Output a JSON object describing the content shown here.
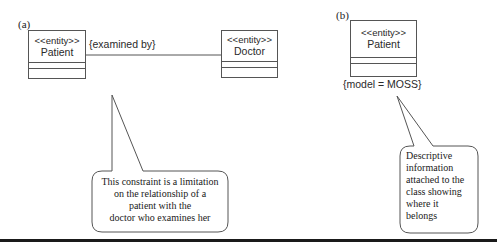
{
  "panels": {
    "a": {
      "label": "(a)",
      "patient": {
        "stereotype": "<<entity>>",
        "name": "Patient"
      },
      "doctor": {
        "stereotype": "<<entity>>",
        "name": "Doctor"
      },
      "association_constraint": "{examined by}",
      "callout": {
        "lines": [
          "This constraint is a limitation",
          "on the relationship of a",
          "patient with the",
          "doctor who examines her"
        ]
      }
    },
    "b": {
      "label": "(b)",
      "patient": {
        "stereotype": "<<entity>>",
        "name": "Patient"
      },
      "tagged_value": "{model = MOSS}",
      "callout": {
        "lines": [
          "Descriptive",
          "information",
          "attached to the",
          "class showing",
          "where it",
          "belongs"
        ]
      }
    }
  },
  "colors": {
    "line": "#555555",
    "text": "#2a2a2a",
    "rule": "#1a1a1a"
  }
}
